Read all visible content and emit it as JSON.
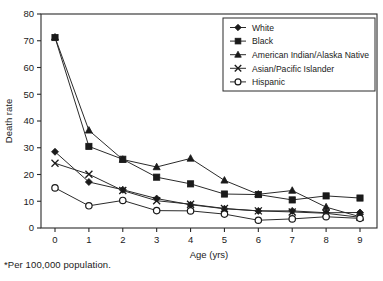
{
  "chart_data": {
    "type": "line",
    "title": "",
    "xlabel": "Age (yrs)",
    "ylabel": "Death rate",
    "x": [
      0,
      1,
      2,
      3,
      4,
      5,
      6,
      7,
      8,
      9
    ],
    "xtick_labels": [
      "0",
      "1",
      "2",
      "3",
      "4",
      "5",
      "6",
      "7",
      "8",
      "9"
    ],
    "ytick_labels": [
      "0",
      "10",
      "20",
      "30",
      "40",
      "50",
      "60",
      "70",
      "80"
    ],
    "yticks": [
      0,
      10,
      20,
      30,
      40,
      50,
      60,
      70,
      80
    ],
    "xlim": [
      0,
      9
    ],
    "ylim": [
      0,
      80
    ],
    "grid": false,
    "legend_position": "top-right",
    "series": [
      {
        "name": "White",
        "marker": "filled-diamond",
        "values": [
          28.5,
          17.2,
          14.3,
          11.0,
          8.7,
          7.2,
          6.4,
          6.4,
          5.7,
          5.8
        ]
      },
      {
        "name": "Black",
        "marker": "filled-square",
        "values": [
          71.2,
          30.5,
          25.7,
          19.0,
          16.5,
          12.7,
          12.5,
          10.5,
          12.0,
          11.2
        ]
      },
      {
        "name": "American Indian/Alaska Native",
        "marker": "filled-triangle",
        "values": [
          71.3,
          36.5,
          25.6,
          22.8,
          26.0,
          17.8,
          12.6,
          14.0,
          7.8,
          4.2
        ]
      },
      {
        "name": "Asian/Pacific Islander",
        "marker": "cross-x",
        "values": [
          24.2,
          20.1,
          14.0,
          10.2,
          8.9,
          7.3,
          6.4,
          6.0,
          5.5,
          4.0
        ]
      },
      {
        "name": "Hispanic",
        "marker": "open-circle",
        "values": [
          15.0,
          8.3,
          10.3,
          6.5,
          6.4,
          5.2,
          2.9,
          3.4,
          4.2,
          3.6
        ]
      }
    ]
  },
  "footnote": "*Per 100,000 population.",
  "legend": {
    "entries": [
      {
        "label": "White"
      },
      {
        "label": "Black"
      },
      {
        "label": "American Indian/Alaska Native"
      },
      {
        "label": "Asian/Pacific Islander"
      },
      {
        "label": "Hispanic"
      }
    ]
  }
}
